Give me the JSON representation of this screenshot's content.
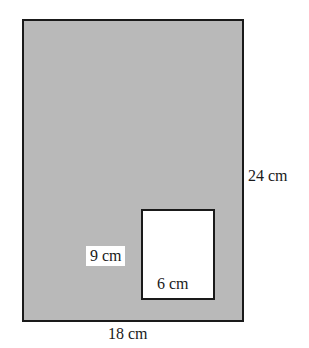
{
  "diagram": {
    "type": "composite-rectangle-area",
    "outer_rectangle": {
      "fill": "#b9b9b9",
      "stroke": "#1a1a1a",
      "width_label": "18 cm",
      "height_label": "24 cm",
      "width_value": 18,
      "height_value": 24,
      "unit": "cm"
    },
    "inner_rectangle": {
      "fill": "#ffffff",
      "stroke": "#1a1a1a",
      "width_label": "6 cm",
      "height_label": "9 cm",
      "width_value": 6,
      "height_value": 9,
      "unit": "cm"
    }
  }
}
